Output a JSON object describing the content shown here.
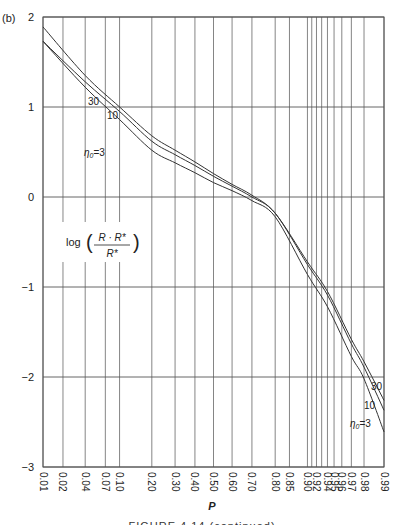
{
  "panel_label": "(b)",
  "caption": "FIGURE 4.14 (continued)",
  "chart_data": {
    "type": "line",
    "title": "",
    "xlabel": "P",
    "ylabel": "log((R - R*)/R*)",
    "annotation": "log((R·R*)/R*)",
    "x_scale": "normal-probability",
    "xlim": [
      0.01,
      0.99
    ],
    "ylim": [
      -3,
      2
    ],
    "grid": true,
    "x_gridlines": [
      0.01,
      0.02,
      0.04,
      0.07,
      0.1,
      0.2,
      0.3,
      0.4,
      0.5,
      0.6,
      0.7,
      0.8,
      0.85,
      0.9,
      0.91,
      0.92,
      0.93,
      0.94,
      0.95,
      0.96,
      0.97,
      0.98,
      0.99
    ],
    "x_tick_labels": [
      "0.01",
      "0.02",
      "0.04",
      "0.07",
      "0.10",
      "0.20",
      "0.30",
      "0.40",
      "0.50",
      "0.60",
      "0.70",
      "0.80",
      "0.85",
      "0.90",
      "0.92",
      "0.94",
      "0.95",
      "0.96",
      "0.97",
      "0.98",
      "0.99"
    ],
    "y_ticks": [
      2,
      1,
      0,
      -1,
      -2,
      -3
    ],
    "y_tick_labels": [
      "2",
      "1",
      "0",
      "−1",
      "−2",
      "−3"
    ],
    "series": [
      {
        "name": "η0=30",
        "label": "30",
        "x": [
          0.01,
          0.04,
          0.1,
          0.2,
          0.3,
          0.4,
          0.5,
          0.6,
          0.7,
          0.8,
          0.9,
          0.94,
          0.97,
          0.98,
          0.99
        ],
        "y": [
          1.89,
          1.35,
          1.0,
          0.68,
          0.52,
          0.39,
          0.26,
          0.14,
          0.02,
          -0.18,
          -0.72,
          -1.05,
          -1.58,
          -1.83,
          -2.26
        ]
      },
      {
        "name": "η0=10",
        "label": "10",
        "x": [
          0.01,
          0.04,
          0.1,
          0.2,
          0.3,
          0.4,
          0.5,
          0.6,
          0.7,
          0.8,
          0.9,
          0.94,
          0.97,
          0.98,
          0.99
        ],
        "y": [
          1.73,
          1.28,
          0.95,
          0.62,
          0.47,
          0.35,
          0.23,
          0.12,
          0.0,
          -0.18,
          -0.75,
          -1.09,
          -1.63,
          -1.89,
          -2.37
        ]
      },
      {
        "name": "η0=3",
        "label": "η0=3",
        "x": [
          0.01,
          0.04,
          0.1,
          0.2,
          0.3,
          0.4,
          0.5,
          0.6,
          0.7,
          0.8,
          0.9,
          0.94,
          0.97,
          0.98,
          0.99
        ],
        "y": [
          1.73,
          1.22,
          0.86,
          0.52,
          0.38,
          0.27,
          0.16,
          0.07,
          -0.04,
          -0.22,
          -0.86,
          -1.22,
          -1.77,
          -2.02,
          -2.61
        ]
      }
    ]
  }
}
